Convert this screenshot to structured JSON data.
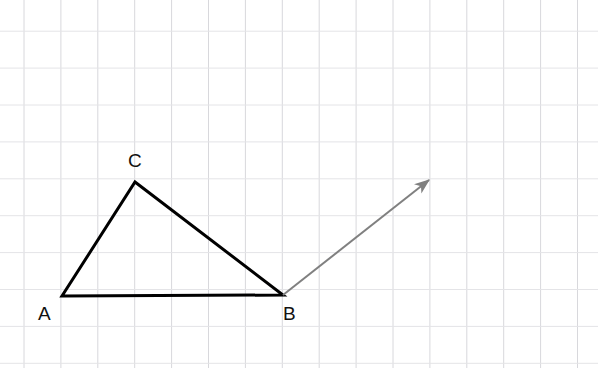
{
  "canvas": {
    "width": 598,
    "height": 368,
    "background": "#ffffff"
  },
  "grid": {
    "spacing": 36.9,
    "offset_x": 24,
    "offset_y": 31.2,
    "color_vertical": "#d8d8dc",
    "color_horizontal": "#e4e4e7",
    "line_width": 1
  },
  "figure": {
    "type": "triangle-with-vector",
    "triangle": {
      "name": "triangle-ABC",
      "stroke": "#000000",
      "stroke_width": 3,
      "fill": "none",
      "vertices": [
        {
          "label": "A",
          "x": 62,
          "y": 296,
          "label_x": 38,
          "label_y": 320
        },
        {
          "label": "B",
          "x": 283,
          "y": 295,
          "label_x": 283,
          "label_y": 320
        },
        {
          "label": "C",
          "x": 135,
          "y": 182,
          "label_x": 128,
          "label_y": 167
        }
      ],
      "edges": [
        {
          "name": "edge-AB",
          "from": "A",
          "to": "B"
        },
        {
          "name": "edge-BC",
          "from": "B",
          "to": "C"
        },
        {
          "name": "edge-CA",
          "from": "C",
          "to": "A"
        }
      ]
    },
    "vector": {
      "name": "translation-vector",
      "stroke": "#808080",
      "stroke_width": 2,
      "start_x": 283,
      "start_y": 295,
      "end_x": 429,
      "end_y": 180,
      "arrowhead": "barbed"
    }
  }
}
